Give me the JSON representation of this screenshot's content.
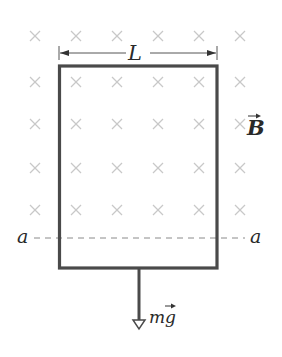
{
  "diagram": {
    "labels": {
      "width": "L",
      "field": "B",
      "boundary_left": "a",
      "boundary_right": "a",
      "weight": "mg"
    },
    "field_symbol": "×",
    "field_grid": {
      "columns_x": [
        35,
        76,
        117,
        158,
        199,
        240
      ],
      "rows_y": [
        36,
        82,
        124,
        168,
        210
      ]
    },
    "colors": {
      "loop": "#4a4a4a",
      "field_marks": "#c8c8c8",
      "dashed_line": "#8a8a8a",
      "text": "#2a2a2a"
    }
  }
}
